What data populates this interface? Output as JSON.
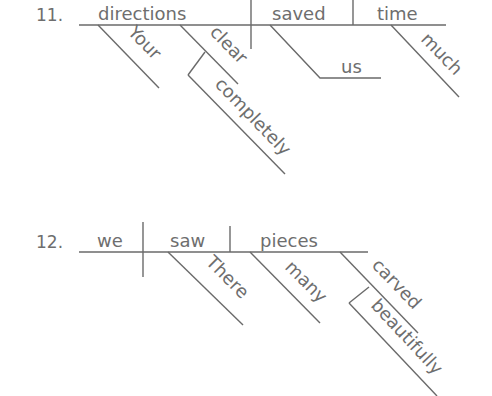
{
  "diagrams": [
    {
      "number": "11.",
      "subject": "directions",
      "verb": "saved",
      "direct_object": "time",
      "indirect_object": "us",
      "modifiers": {
        "directions": [
          "Your",
          "clear"
        ],
        "clear": [
          "completely"
        ],
        "time": [
          "much"
        ]
      },
      "words": {
        "your": "Your",
        "clear": "clear",
        "completely": "completely",
        "us": "us",
        "much": "much"
      }
    },
    {
      "number": "12.",
      "subject": "we",
      "verb": "saw",
      "direct_object": "pieces",
      "modifiers": {
        "saw": [
          "There"
        ],
        "pieces": [
          "many",
          "carved"
        ],
        "carved": [
          "beautifully"
        ]
      },
      "words": {
        "there": "There",
        "many": "many",
        "carved": "carved",
        "beautifully": "beautifully"
      }
    }
  ],
  "colors": {
    "ink": "#6e6e6e",
    "background": "#ffffff"
  }
}
